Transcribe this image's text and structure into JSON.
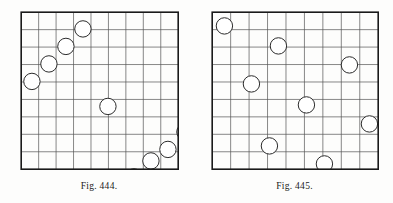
{
  "page": {
    "background_color": "#fdfdfc",
    "ink_color": "#2b2b2b",
    "border_color": "#1a1a1a"
  },
  "figures": [
    {
      "id": "figure-444",
      "caption": "Fig. 444.",
      "caption_label": "Fig.",
      "caption_number": "444.",
      "grid": {
        "columns": 9,
        "rows": 9,
        "cell_size": 17.4,
        "width": 157,
        "height": 157,
        "border_color": "#1a1a1a",
        "line_color": "#555555",
        "border_width": 1.6,
        "line_width": 0.7
      },
      "circles": {
        "radius": 8.2,
        "stroke_color": "#2b2b2b",
        "fill_color": "#ffffff",
        "stroke_width": 1.0,
        "count": 9,
        "positions": [
          {
            "cx": 53.0,
            "cy": 8.0
          },
          {
            "cx": 36.0,
            "cy": 25.5
          },
          {
            "cx": 19.0,
            "cy": 43.0
          },
          {
            "cx": 2.0,
            "cy": 60.5
          },
          {
            "cx": 78.0,
            "cy": 85.5
          },
          {
            "cx": 155.0,
            "cy": 111.0
          },
          {
            "cx": 138.0,
            "cy": 128.5
          },
          {
            "cx": 121.0,
            "cy": 140.0
          },
          {
            "cx": 104.0,
            "cy": 156.0
          }
        ]
      }
    },
    {
      "id": "figure-445",
      "caption": "Fig. 445.",
      "caption_label": "Fig.",
      "caption_number": "445.",
      "grid": {
        "columns": 9,
        "rows": 9,
        "cell_size": 18.4,
        "width": 166,
        "height": 157,
        "border_color": "#1a1a1a",
        "line_color": "#555555",
        "border_width": 1.6,
        "line_width": 0.7
      },
      "circles": {
        "radius": 8.2,
        "stroke_color": "#2b2b2b",
        "fill_color": "#ffffff",
        "stroke_width": 1.0,
        "count": 9,
        "positions": [
          {
            "cx": 3.0,
            "cy": 5.0
          },
          {
            "cx": 57.0,
            "cy": 25.0
          },
          {
            "cx": 128.0,
            "cy": 44.0
          },
          {
            "cx": 30.0,
            "cy": 63.0
          },
          {
            "cx": 85.0,
            "cy": 84.0
          },
          {
            "cx": 148.0,
            "cy": 103.0
          },
          {
            "cx": 48.0,
            "cy": 125.0
          },
          {
            "cx": 103.0,
            "cy": 143.0
          },
          {
            "cx": 159.0,
            "cy": 157.0
          }
        ]
      }
    }
  ]
}
